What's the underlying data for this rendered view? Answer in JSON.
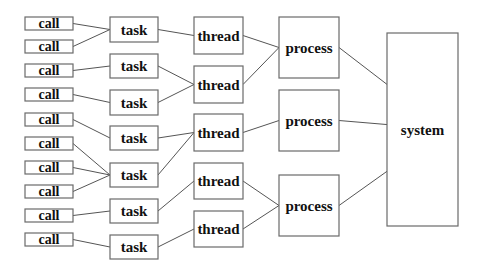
{
  "diagram": {
    "title": "",
    "levels": [
      "call",
      "task",
      "thread",
      "process",
      "system"
    ],
    "nodes": {
      "calls": [
        {
          "id": "c1",
          "label": "call",
          "x": 25,
          "y": 17,
          "w": 48,
          "h": 13
        },
        {
          "id": "c2",
          "label": "call",
          "x": 25,
          "y": 40,
          "w": 48,
          "h": 13
        },
        {
          "id": "c3",
          "label": "call",
          "x": 25,
          "y": 64,
          "w": 48,
          "h": 13
        },
        {
          "id": "c4",
          "label": "call",
          "x": 25,
          "y": 88,
          "w": 48,
          "h": 13
        },
        {
          "id": "c5",
          "label": "call",
          "x": 25,
          "y": 113,
          "w": 48,
          "h": 13
        },
        {
          "id": "c6",
          "label": "call",
          "x": 25,
          "y": 137,
          "w": 48,
          "h": 13
        },
        {
          "id": "c7",
          "label": "call",
          "x": 25,
          "y": 161,
          "w": 48,
          "h": 13
        },
        {
          "id": "c8",
          "label": "call",
          "x": 25,
          "y": 185,
          "w": 48,
          "h": 13
        },
        {
          "id": "c9",
          "label": "call",
          "x": 25,
          "y": 209,
          "w": 48,
          "h": 13
        },
        {
          "id": "c10",
          "label": "call",
          "x": 25,
          "y": 233,
          "w": 48,
          "h": 13
        }
      ],
      "tasks": [
        {
          "id": "t1",
          "label": "task",
          "x": 110,
          "y": 17,
          "w": 48,
          "h": 25
        },
        {
          "id": "t2",
          "label": "task",
          "x": 110,
          "y": 54,
          "w": 48,
          "h": 24
        },
        {
          "id": "t3",
          "label": "task",
          "x": 110,
          "y": 90,
          "w": 48,
          "h": 25
        },
        {
          "id": "t4",
          "label": "task",
          "x": 110,
          "y": 126,
          "w": 48,
          "h": 24
        },
        {
          "id": "t5",
          "label": "task",
          "x": 110,
          "y": 163,
          "w": 48,
          "h": 24
        },
        {
          "id": "t6",
          "label": "task",
          "x": 110,
          "y": 199,
          "w": 48,
          "h": 24
        },
        {
          "id": "t7",
          "label": "task",
          "x": 110,
          "y": 235,
          "w": 48,
          "h": 24
        }
      ],
      "threads": [
        {
          "id": "th1",
          "label": "thread",
          "x": 194,
          "y": 17,
          "w": 49,
          "h": 37
        },
        {
          "id": "th2",
          "label": "thread",
          "x": 194,
          "y": 66,
          "w": 49,
          "h": 37
        },
        {
          "id": "th3",
          "label": "thread",
          "x": 194,
          "y": 114,
          "w": 49,
          "h": 37
        },
        {
          "id": "th4",
          "label": "thread",
          "x": 194,
          "y": 163,
          "w": 49,
          "h": 36
        },
        {
          "id": "th5",
          "label": "thread",
          "x": 194,
          "y": 211,
          "w": 49,
          "h": 36
        }
      ],
      "processes": [
        {
          "id": "p1",
          "label": "process",
          "x": 279,
          "y": 17,
          "w": 60,
          "h": 61
        },
        {
          "id": "p2",
          "label": "process",
          "x": 279,
          "y": 90,
          "w": 60,
          "h": 61
        },
        {
          "id": "p3",
          "label": "process",
          "x": 279,
          "y": 175,
          "w": 60,
          "h": 61
        }
      ],
      "system": {
        "id": "s1",
        "label": "system",
        "x": 387,
        "y": 33,
        "w": 71,
        "h": 193
      }
    },
    "edges": [
      [
        "c1",
        "t1"
      ],
      [
        "c2",
        "t1"
      ],
      [
        "c3",
        "t2"
      ],
      [
        "c4",
        "t3"
      ],
      [
        "c5",
        "t4"
      ],
      [
        "c6",
        "t5"
      ],
      [
        "c7",
        "t5"
      ],
      [
        "c8",
        "t5"
      ],
      [
        "c9",
        "t6"
      ],
      [
        "c10",
        "t7"
      ],
      [
        "t1",
        "th1"
      ],
      [
        "t2",
        "th2"
      ],
      [
        "t3",
        "th2"
      ],
      [
        "t4",
        "th3"
      ],
      [
        "t5",
        "th3"
      ],
      [
        "t6",
        "th4"
      ],
      [
        "t7",
        "th5"
      ],
      [
        "th1",
        "p1"
      ],
      [
        "th2",
        "p1"
      ],
      [
        "th3",
        "p2"
      ],
      [
        "th4",
        "p3"
      ],
      [
        "th5",
        "p3"
      ],
      [
        "p1",
        "s1"
      ],
      [
        "p2",
        "s1"
      ],
      [
        "p3",
        "s1"
      ]
    ],
    "colors": {
      "box_stroke": "#6a6a6a",
      "edge": "#555555",
      "text": "#111111",
      "background": "#ffffff"
    }
  }
}
